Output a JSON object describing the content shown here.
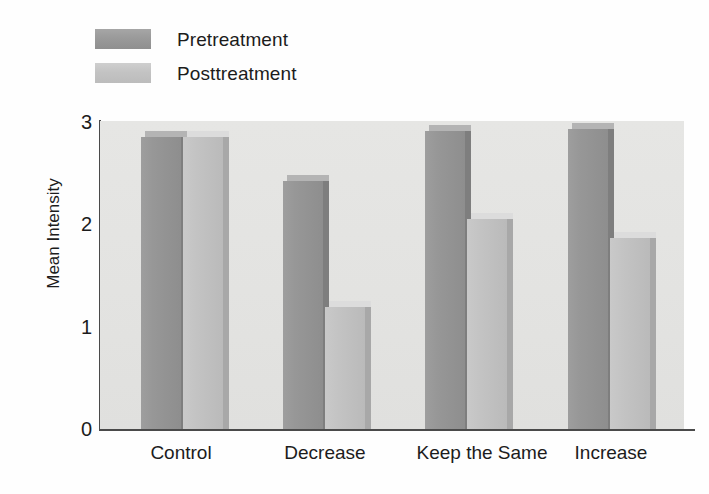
{
  "chart_data": {
    "type": "bar",
    "title": "",
    "xlabel": "",
    "ylabel": "Mean Intensity",
    "ylim": [
      0,
      3
    ],
    "yticks": [
      "0",
      "1",
      "2",
      "3"
    ],
    "grid": false,
    "legend_position": "top-left",
    "categories": [
      "Control",
      "Decrease",
      "Keep the Same",
      "Increase"
    ],
    "series": [
      {
        "name": "Pretreatment",
        "color": "#979797",
        "values": [
          2.9,
          2.47,
          2.96,
          2.98
        ]
      },
      {
        "name": "Posttreatment",
        "color": "#c3c3c3",
        "values": [
          2.9,
          1.25,
          2.1,
          1.92
        ]
      }
    ]
  },
  "legend": {
    "items": [
      {
        "label": "Pretreatment",
        "swatch": "pre"
      },
      {
        "label": "Posttreatment",
        "swatch": "post"
      }
    ]
  },
  "axes": {
    "y_title": "Mean Intensity",
    "y_ticks": [
      "3",
      "2",
      "1",
      "0"
    ],
    "x_categories": [
      "Control",
      "Decrease",
      "Keep the Same",
      "Increase"
    ]
  },
  "colors": {
    "plot_background": "#e3e3e1",
    "axis": "#4a4a4a",
    "pretreatment": "#979797",
    "posttreatment": "#c3c3c3",
    "page_background": "#ffffff",
    "text": "#1c1c1c"
  }
}
